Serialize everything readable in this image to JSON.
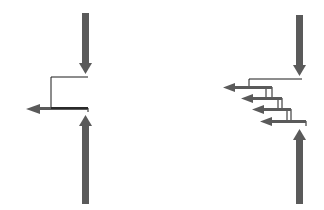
{
  "diagram": {
    "colors": {
      "arrow": "#5a5a5a",
      "line": "#1a1a1a",
      "background": "#ffffff"
    },
    "panels": [
      {
        "id": "single-outflow",
        "lateral_arrows": 1
      },
      {
        "id": "multiple-outflow",
        "lateral_arrows": 4
      }
    ]
  }
}
